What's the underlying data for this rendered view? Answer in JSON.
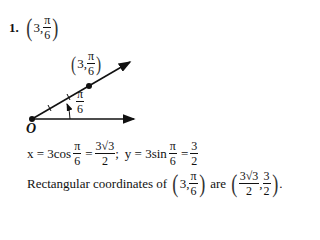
{
  "problem": {
    "number": "1.",
    "point_r": "3,",
    "point_theta_num": "π",
    "point_theta_den": "6"
  },
  "figure": {
    "point_label_r": "3,",
    "point_label_num": "π",
    "point_label_den": "6",
    "angle_label_num": "π",
    "angle_label_den": "6",
    "origin_label": "O"
  },
  "equations": {
    "x_lhs": "x = 3cos",
    "x_frac_num": "π",
    "x_frac_den": "6",
    "x_eq": "=",
    "x_res_num": "3√3",
    "x_res_den": "2",
    "sep": ";",
    "y_lhs": "y = 3sin",
    "y_frac_num": "π",
    "y_frac_den": "6",
    "y_eq": "=",
    "y_res_num": "3",
    "y_res_den": "2"
  },
  "conclusion": {
    "prefix": "Rectangular coordinates of",
    "polar_r": "3,",
    "polar_num": "π",
    "polar_den": "6",
    "mid": "are",
    "rect_x_num": "3√3",
    "rect_x_den": "2",
    "comma": ",",
    "rect_y_num": "3",
    "rect_y_den": "2",
    "end": "."
  }
}
